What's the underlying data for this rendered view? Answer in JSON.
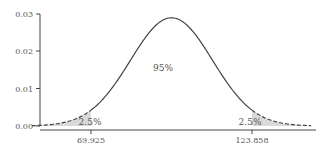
{
  "chart_data": {
    "type": "area",
    "title": "",
    "xlabel": "",
    "ylabel": "",
    "distribution": "normal",
    "mean": 96.89,
    "sd": 13.76,
    "ylim": [
      0,
      0.03
    ],
    "yticks": [
      "0.00",
      "0.01",
      "0.02",
      "0.03"
    ],
    "xticks": [
      "69.925",
      "123.858"
    ],
    "critical_values": [
      69.925,
      123.858
    ],
    "regions": [
      {
        "name": "left-tail",
        "label": "2.5%",
        "range": [
          null,
          69.925
        ],
        "shaded": true,
        "line": "dashed"
      },
      {
        "name": "center",
        "label": "95%",
        "range": [
          69.925,
          123.858
        ],
        "shaded": false,
        "line": "solid"
      },
      {
        "name": "right-tail",
        "label": "2.5%",
        "range": [
          123.858,
          null
        ],
        "shaded": true,
        "line": "dashed"
      }
    ],
    "grid": false,
    "legend": null
  },
  "labels": {
    "y0": "0.00",
    "y1": "0.01",
    "y2": "0.02",
    "y3": "0.03",
    "x_left": "69.925",
    "x_right": "123.858",
    "left_tail": "2.5%",
    "center": "95%",
    "right_tail": "2.5%"
  },
  "colors": {
    "curve": "#444444",
    "shade": "#d9d9d9",
    "axis": "#444444"
  }
}
